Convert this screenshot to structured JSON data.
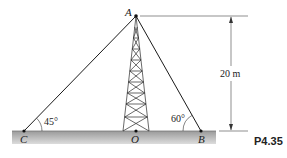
{
  "figure": {
    "problem_id": "P4.35",
    "points": {
      "A": "A",
      "B": "B",
      "C": "C",
      "O": "O"
    },
    "angles": {
      "at_C": "45°",
      "at_B": "60°"
    },
    "dimension": {
      "height_label": "20 m"
    },
    "colors": {
      "line": "#1a1a1a",
      "ground_top": "#9a9a9a",
      "ground_bottom": "#d8d8d8"
    }
  }
}
